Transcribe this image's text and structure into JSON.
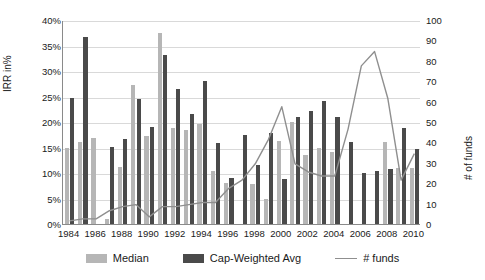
{
  "chart_data": {
    "type": "bar",
    "title": "",
    "xlabel": "",
    "ylabel": "IRR in%",
    "y2label": "# of funds",
    "ylim": [
      0,
      40
    ],
    "y2lim": [
      0,
      100
    ],
    "grid": true,
    "legend_position": "bottom",
    "categories": [
      1984,
      1985,
      1986,
      1987,
      1988,
      1989,
      1990,
      1991,
      1992,
      1993,
      1994,
      1995,
      1996,
      1997,
      1998,
      1999,
      2000,
      2001,
      2002,
      2003,
      2004,
      2005,
      2006,
      2007,
      2008,
      2009,
      2010
    ],
    "xtick_labels": [
      "1984",
      "1986",
      "1988",
      "1990",
      "1992",
      "1994",
      "1996",
      "1998",
      "2000",
      "2002",
      "2004",
      "2006",
      "2008",
      "2010"
    ],
    "ytick_labels": [
      "0%",
      "5%",
      "10%",
      "15%",
      "20%",
      "25%",
      "30%",
      "35%",
      "40%"
    ],
    "ytick_values": [
      0,
      5,
      10,
      15,
      20,
      25,
      30,
      35,
      40
    ],
    "y2tick_labels": [
      "0",
      "10",
      "20",
      "30",
      "40",
      "50",
      "60",
      "70",
      "80",
      "90",
      "100"
    ],
    "y2tick_values": [
      0,
      10,
      20,
      30,
      40,
      50,
      60,
      70,
      80,
      90,
      100
    ],
    "series": [
      {
        "name": "Median",
        "axis": "left",
        "color": "#b6b6b6",
        "values": [
          15.0,
          16.0,
          16.8,
          1.0,
          11.2,
          27.2,
          17.2,
          37.5,
          18.8,
          18.4,
          19.7,
          10.4,
          8.0,
          0.0,
          7.8,
          5.0,
          16.2,
          20.0,
          13.6,
          15.0,
          14.2,
          0.0,
          0.0,
          0.0,
          16.0,
          11.0,
          11.0
        ]
      },
      {
        "name": "Cap-Weighted Avg",
        "axis": "left",
        "color": "#4a4a4a",
        "values": [
          24.7,
          36.6,
          0.0,
          15.1,
          16.6,
          24.6,
          19.1,
          33.1,
          26.5,
          21.5,
          28.1,
          15.9,
          9.0,
          17.5,
          11.5,
          17.8,
          8.8,
          20.9,
          22.2,
          24.2,
          21.0,
          16.0,
          10.1,
          10.3,
          10.8,
          18.8,
          14.8
        ]
      },
      {
        "name": "# funds",
        "axis": "right",
        "color": "#8f8f8f",
        "values": [
          2,
          3,
          3,
          7,
          9,
          10,
          4,
          9,
          9,
          10,
          11,
          11,
          18,
          22,
          30,
          42,
          58,
          30,
          26,
          24,
          24,
          47,
          78,
          85,
          62,
          22,
          35
        ]
      }
    ]
  },
  "legend": {
    "items": [
      {
        "label": "Median",
        "swatch": "median-swatch"
      },
      {
        "label": "Cap-Weighted Avg",
        "swatch": "capwtd-swatch"
      },
      {
        "label": "# funds",
        "swatch": "line-swatch"
      }
    ]
  }
}
